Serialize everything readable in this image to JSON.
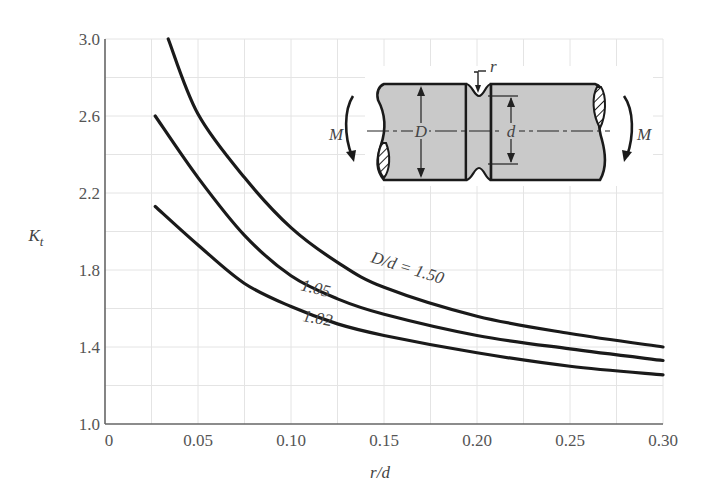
{
  "chart_data": {
    "type": "line",
    "title": "",
    "xlabel": "r/d",
    "ylabel": "K_t",
    "xlim": [
      0,
      0.3
    ],
    "ylim": [
      1.0,
      3.0
    ],
    "x_ticks": [
      "0",
      "0.05",
      "0.10",
      "0.15",
      "0.20",
      "0.25",
      "0.30"
    ],
    "y_ticks": [
      "1.0",
      "1.4",
      "1.8",
      "2.2",
      "2.6",
      "3.0"
    ],
    "grid": true,
    "grid_x_step": 0.025,
    "grid_y_step": 0.2,
    "legend_position": "inline curve labels",
    "series": [
      {
        "name": "D/d = 1.50",
        "label": "D/d = 1.50",
        "x": [
          0.034,
          0.05,
          0.075,
          0.1,
          0.125,
          0.15,
          0.2,
          0.25,
          0.3
        ],
        "y": [
          3.0,
          2.61,
          2.28,
          2.02,
          1.84,
          1.71,
          1.56,
          1.47,
          1.4
        ]
      },
      {
        "name": "D/d = 1.05",
        "label": "1.05",
        "x": [
          0.027,
          0.05,
          0.075,
          0.1,
          0.125,
          0.15,
          0.2,
          0.25,
          0.3
        ],
        "y": [
          2.6,
          2.28,
          1.98,
          1.77,
          1.65,
          1.57,
          1.46,
          1.39,
          1.33
        ]
      },
      {
        "name": "D/d = 1.02",
        "label": "1.02",
        "x": [
          0.027,
          0.05,
          0.075,
          0.1,
          0.125,
          0.15,
          0.2,
          0.25,
          0.3
        ],
        "y": [
          2.13,
          1.93,
          1.73,
          1.61,
          1.52,
          1.46,
          1.37,
          1.3,
          1.255
        ]
      }
    ],
    "inset_diagram": {
      "description": "Shaft with circumferential groove under bending moment",
      "labels": [
        "r",
        "D",
        "d",
        "M",
        "M"
      ]
    }
  }
}
